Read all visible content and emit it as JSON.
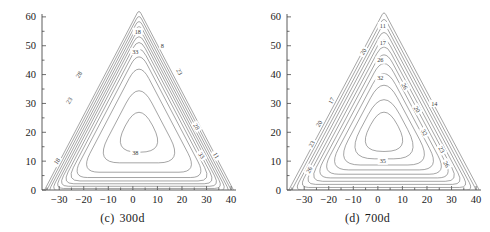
{
  "figure": {
    "type": "contour-plot-pair",
    "background": "#ffffff",
    "line_color": "#6d6d6d",
    "axis_color": "#4a4a4a",
    "text_color": "#222222"
  },
  "panels": [
    {
      "id": "panel-c",
      "caption_label": "(c)",
      "caption_text": "300d",
      "xlabel": "",
      "ylabel": "",
      "xticks": [
        -30,
        -20,
        -10,
        0,
        10,
        20,
        30,
        40
      ],
      "yticks": [
        0,
        10,
        20,
        30,
        40,
        50,
        60
      ],
      "xlim": [
        -37,
        42
      ],
      "ylim": [
        0,
        61
      ],
      "contour_labels": [
        {
          "text": "18",
          "x": 2,
          "y": 55,
          "rot": 0
        },
        {
          "text": "33",
          "x": 1,
          "y": 48,
          "rot": 0
        },
        {
          "text": "38",
          "x": 1,
          "y": 13,
          "rot": 0
        },
        {
          "text": "28",
          "x": -22,
          "y": 40,
          "rot": -57
        },
        {
          "text": "23",
          "x": -26,
          "y": 31,
          "rot": -57
        },
        {
          "text": "18",
          "x": -31,
          "y": 10,
          "rot": -57
        },
        {
          "text": "23",
          "x": 19,
          "y": 41,
          "rot": 58
        },
        {
          "text": "28",
          "x": 26,
          "y": 22,
          "rot": 58
        },
        {
          "text": "33",
          "x": 28,
          "y": 12,
          "rot": 58
        },
        {
          "text": "11",
          "x": 34,
          "y": 12,
          "rot": 58
        },
        {
          "text": "8",
          "x": 12,
          "y": 50,
          "rot": 0
        }
      ]
    },
    {
      "id": "panel-d",
      "caption_label": "(d)",
      "caption_text": "700d",
      "xlabel": "",
      "ylabel": "",
      "xticks": [
        -30,
        -20,
        -10,
        0,
        10,
        20,
        30,
        40
      ],
      "yticks": [
        0,
        10,
        20,
        30,
        40,
        50,
        60
      ],
      "xlim": [
        -37,
        42
      ],
      "ylim": [
        0,
        61
      ],
      "contour_labels": [
        {
          "text": "11",
          "x": 2,
          "y": 57,
          "rot": 0
        },
        {
          "text": "17",
          "x": 2,
          "y": 51,
          "rot": 0
        },
        {
          "text": "26",
          "x": 1,
          "y": 45,
          "rot": 0
        },
        {
          "text": "32",
          "x": 1,
          "y": 39,
          "rot": 0
        },
        {
          "text": "35",
          "x": 2,
          "y": 10,
          "rot": 0
        },
        {
          "text": "20",
          "x": -6,
          "y": 48,
          "rot": -60
        },
        {
          "text": "17",
          "x": -19,
          "y": 31,
          "rot": -60
        },
        {
          "text": "20",
          "x": -24,
          "y": 23,
          "rot": -60
        },
        {
          "text": "23",
          "x": -27,
          "y": 16,
          "rot": -60
        },
        {
          "text": "26",
          "x": -28,
          "y": 7,
          "rot": -60
        },
        {
          "text": "26",
          "x": 11,
          "y": 36,
          "rot": 60
        },
        {
          "text": "20",
          "x": 16,
          "y": 28,
          "rot": 60
        },
        {
          "text": "14",
          "x": 23,
          "y": 30,
          "rot": 0
        },
        {
          "text": "32",
          "x": 19,
          "y": 20,
          "rot": 60
        },
        {
          "text": "23",
          "x": 26,
          "y": 14,
          "rot": 60
        },
        {
          "text": "26",
          "x": 28,
          "y": 9,
          "rot": 60
        }
      ]
    }
  ],
  "chart_data": {
    "type": "contour",
    "title": "",
    "panel_count": 2,
    "shared": {
      "xlabel": "",
      "ylabel": "",
      "xlim": [
        -37,
        42
      ],
      "ylim": [
        0,
        61
      ],
      "xticks": [
        -30,
        -20,
        -10,
        0,
        10,
        20,
        30,
        40
      ],
      "yticks": [
        0,
        10,
        20,
        30,
        40,
        50,
        60
      ],
      "grid": false,
      "legend": "none",
      "domain_shape": "triangular"
    },
    "panels": [
      {
        "name": "(c) 300d",
        "levels": [
          8,
          11,
          18,
          23,
          28,
          33,
          38
        ],
        "level_labels": [
          "8",
          "11",
          "18",
          "23",
          "28",
          "33",
          "38"
        ],
        "innermost_level": 38,
        "outermost_level": 8,
        "apex": {
          "x": 2,
          "y": 60
        },
        "base_left": {
          "x": -36,
          "y": 0
        },
        "base_right": {
          "x": 41,
          "y": 0
        }
      },
      {
        "name": "(d) 700d",
        "levels": [
          11,
          14,
          17,
          20,
          23,
          26,
          32,
          35
        ],
        "level_labels": [
          "11",
          "14",
          "17",
          "20",
          "23",
          "26",
          "32",
          "35"
        ],
        "innermost_level": 35,
        "outermost_level": 11,
        "apex": {
          "x": 2,
          "y": 60
        },
        "base_left": {
          "x": -36,
          "y": 0
        },
        "base_right": {
          "x": 41,
          "y": 0
        }
      }
    ]
  }
}
